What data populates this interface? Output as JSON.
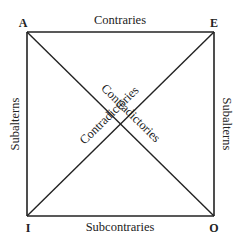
{
  "diagram": {
    "corners": {
      "top_left": "A",
      "top_right": "E",
      "bottom_left": "I",
      "bottom_right": "O"
    },
    "edges": {
      "top": "Contraries",
      "bottom": "Subcontraries",
      "left": "Subalterns",
      "right": "Subalterns"
    },
    "diagonals": {
      "a_to_o": "Contradictories",
      "i_to_e": "Contradictories"
    },
    "colors": {
      "line": "#222222",
      "text": "#222222",
      "background": "#ffffff"
    }
  }
}
